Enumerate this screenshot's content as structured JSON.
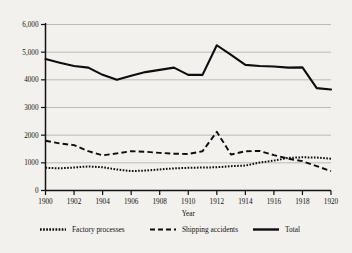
{
  "chart_data": {
    "type": "line",
    "title": "",
    "xlabel": "Year",
    "ylabel": "",
    "xlim": [
      1900,
      1920
    ],
    "ylim": [
      0,
      6000
    ],
    "grid": true,
    "legend_position": "bottom",
    "x": [
      1900,
      1901,
      1902,
      1903,
      1904,
      1905,
      1906,
      1907,
      1908,
      1909,
      1910,
      1911,
      1912,
      1913,
      1914,
      1915,
      1916,
      1917,
      1918,
      1919,
      1920
    ],
    "xticks": [
      "1900",
      "1902",
      "1904",
      "1906",
      "1908",
      "1910",
      "1912",
      "1914",
      "1916",
      "1918",
      "1920"
    ],
    "yticks": [
      "0",
      "1000",
      "2000",
      "3000",
      "4000",
      "5,000",
      "6,000"
    ],
    "ytick_values": [
      0,
      1000,
      2000,
      3000,
      4000,
      5000,
      6000
    ],
    "series": [
      {
        "name": "Factory processes",
        "style": "dotted",
        "values": [
          820,
          800,
          830,
          870,
          840,
          760,
          700,
          720,
          760,
          800,
          820,
          830,
          840,
          880,
          900,
          1010,
          1080,
          1180,
          1200,
          1190,
          1150
        ]
      },
      {
        "name": "Shipping accidents",
        "style": "dashed",
        "values": [
          1800,
          1700,
          1640,
          1420,
          1270,
          1340,
          1420,
          1400,
          1360,
          1330,
          1320,
          1420,
          2120,
          1300,
          1420,
          1430,
          1280,
          1150,
          1060,
          880,
          700
        ]
      },
      {
        "name": "Total",
        "style": "solid",
        "values": [
          4750,
          4620,
          4500,
          4440,
          4180,
          4000,
          4150,
          4280,
          4360,
          4440,
          4180,
          4180,
          5250,
          4900,
          4540,
          4500,
          4480,
          4440,
          4450,
          3700,
          3650
        ]
      }
    ]
  },
  "legend": {
    "items": [
      {
        "label": "Factory processes"
      },
      {
        "label": "Shipping accidents"
      },
      {
        "label": "Total"
      }
    ]
  }
}
